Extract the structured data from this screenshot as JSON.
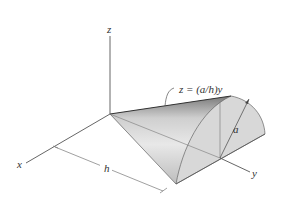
{
  "figure": {
    "type": "3D solid diagram",
    "axes": {
      "x_label": "x",
      "y_label": "y",
      "z_label": "z"
    },
    "surface_equation": "z = (a/h)y",
    "dimensions": {
      "length_label": "h",
      "radius_label": "a"
    },
    "colors": {
      "lines": "#555555",
      "surface_light": "#e6e6e6",
      "surface_dark": "#9a9a9a",
      "base_face": "#d9d9d9"
    }
  }
}
